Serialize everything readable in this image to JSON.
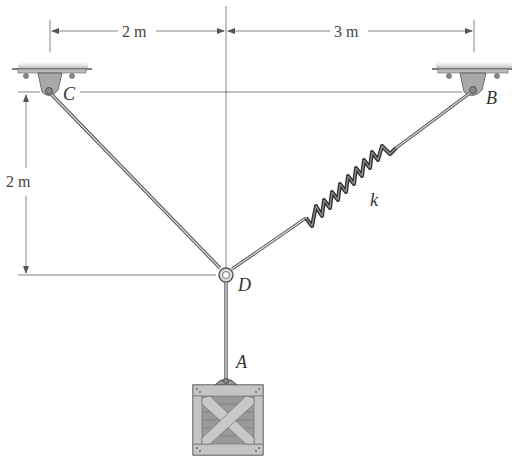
{
  "dimensions": {
    "horiz_left": "2 m",
    "horiz_right": "3 m",
    "vert_left": "2 m"
  },
  "points": {
    "C": "C",
    "B": "B",
    "D": "D",
    "A": "A"
  },
  "spring_label": "k",
  "colors": {
    "line": "#555555",
    "support": "#a8a8a8",
    "ground": "#c8c8c8",
    "crate": "#b8b8b8",
    "crate_dark": "#8a8a8a"
  },
  "elements": [
    {
      "name": "support-C",
      "type": "pin-support"
    },
    {
      "name": "support-B",
      "type": "pin-support"
    },
    {
      "name": "cable-CD",
      "type": "cable"
    },
    {
      "name": "spring-DB",
      "type": "spring",
      "label": "k"
    },
    {
      "name": "ring-D",
      "type": "ring"
    },
    {
      "name": "cable-DA",
      "type": "cable"
    },
    {
      "name": "crate",
      "type": "load"
    }
  ]
}
